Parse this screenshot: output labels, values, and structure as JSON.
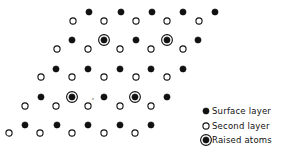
{
  "colors": {
    "ink": "#111111",
    "background": "#ffffff"
  },
  "atom_radius": 3.1,
  "raised_ring_radius": 5.4,
  "atoms": {
    "surface": [
      [
        89,
        12
      ],
      [
        121,
        12
      ],
      [
        152,
        12
      ],
      [
        183,
        12
      ],
      [
        215,
        12
      ],
      [
        72,
        40
      ],
      [
        136,
        40
      ],
      [
        198,
        40
      ],
      [
        56,
        69
      ],
      [
        88,
        69
      ],
      [
        120,
        69
      ],
      [
        151,
        69
      ],
      [
        183,
        69
      ],
      [
        41,
        97
      ],
      [
        104,
        97
      ],
      [
        167,
        97
      ],
      [
        25,
        125
      ],
      [
        57,
        125
      ],
      [
        88,
        125
      ],
      [
        120,
        125
      ],
      [
        151,
        125
      ]
    ],
    "second": [
      [
        73,
        21
      ],
      [
        104,
        21
      ],
      [
        136,
        21
      ],
      [
        167,
        21
      ],
      [
        199,
        21
      ],
      [
        57,
        49
      ],
      [
        88,
        49
      ],
      [
        120,
        49
      ],
      [
        151,
        49
      ],
      [
        183,
        49
      ],
      [
        41,
        77
      ],
      [
        72,
        77
      ],
      [
        104,
        77
      ],
      [
        136,
        77
      ],
      [
        167,
        77
      ],
      [
        25,
        106
      ],
      [
        56,
        106
      ],
      [
        88,
        106
      ],
      [
        120,
        106
      ],
      [
        151,
        106
      ],
      [
        9,
        133
      ],
      [
        40,
        133
      ],
      [
        72,
        133
      ],
      [
        104,
        133
      ],
      [
        135,
        133
      ]
    ],
    "raised": [
      [
        104,
        40
      ],
      [
        167,
        40
      ],
      [
        72,
        97
      ],
      [
        135,
        97
      ]
    ]
  },
  "annotations": [
    {
      "text": "'",
      "x": 92,
      "y": 103
    }
  ],
  "legend": {
    "items": [
      {
        "type": "surface",
        "label": "Surface layer",
        "x": 206,
        "y": 111
      },
      {
        "type": "second",
        "label": "Second layer",
        "x": 206,
        "y": 126
      },
      {
        "type": "raised",
        "label": "Raised atoms",
        "x": 206,
        "y": 140
      }
    ]
  }
}
